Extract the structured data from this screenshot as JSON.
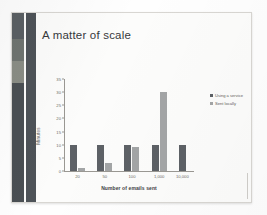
{
  "slide": {
    "title": "A matter of scale",
    "bands": [
      {
        "name": "band-outer",
        "segments": [
          {
            "color": "#5a5f63",
            "top": 0,
            "height": 26
          },
          {
            "color": "#6f7470",
            "top": 26,
            "height": 22
          },
          {
            "color": "#8a8d85",
            "top": 48,
            "height": 22
          },
          {
            "color": "#4a4f53",
            "top": 70,
            "height": 119
          }
        ]
      },
      {
        "name": "band-inner",
        "segments": [
          {
            "color": "#4e5358",
            "top": 0,
            "height": 189
          }
        ]
      }
    ]
  },
  "legend": {
    "position": "right",
    "entries": [
      {
        "label": "Using a service",
        "color": "#5d6166"
      },
      {
        "label": "Sent locally",
        "color": "#a3a5a6"
      }
    ]
  },
  "chart_data": {
    "type": "bar",
    "title": "A matter of scale",
    "xlabel": "Number of emails sent",
    "ylabel": "Minutes",
    "categories": [
      "20",
      "50",
      "100",
      "1,000",
      "10,000"
    ],
    "series": [
      {
        "name": "Using a service",
        "color": "#5d6166",
        "values": [
          10,
          10,
          10,
          10,
          10
        ]
      },
      {
        "name": "Sent locally",
        "color": "#a3a5a6",
        "values": [
          1,
          3,
          9,
          30,
          0
        ]
      }
    ],
    "ylim": [
      0,
      35
    ],
    "yticks": [
      "0",
      "5",
      "10",
      "15",
      "20",
      "25",
      "30",
      "35"
    ],
    "grid": false,
    "legend_position": "right"
  }
}
